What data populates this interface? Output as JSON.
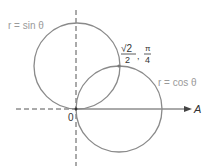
{
  "figure": {
    "type": "polar-curves",
    "curves": [
      {
        "label": "r = sin θ",
        "equation": "r = sin θ"
      },
      {
        "label": "r = cos θ",
        "equation": "r = cos θ"
      }
    ],
    "intersection": {
      "r_numerator": "√2",
      "r_denominator": "2",
      "theta_numerator": "π",
      "theta_denominator": "4",
      "separator": ","
    },
    "origin_label": "0",
    "polar_axis_label": "A"
  },
  "colors": {
    "curve": "#8a8a8a",
    "axis": "#555555",
    "label_light": "#9a9a9a",
    "label_dark": "#333333"
  }
}
